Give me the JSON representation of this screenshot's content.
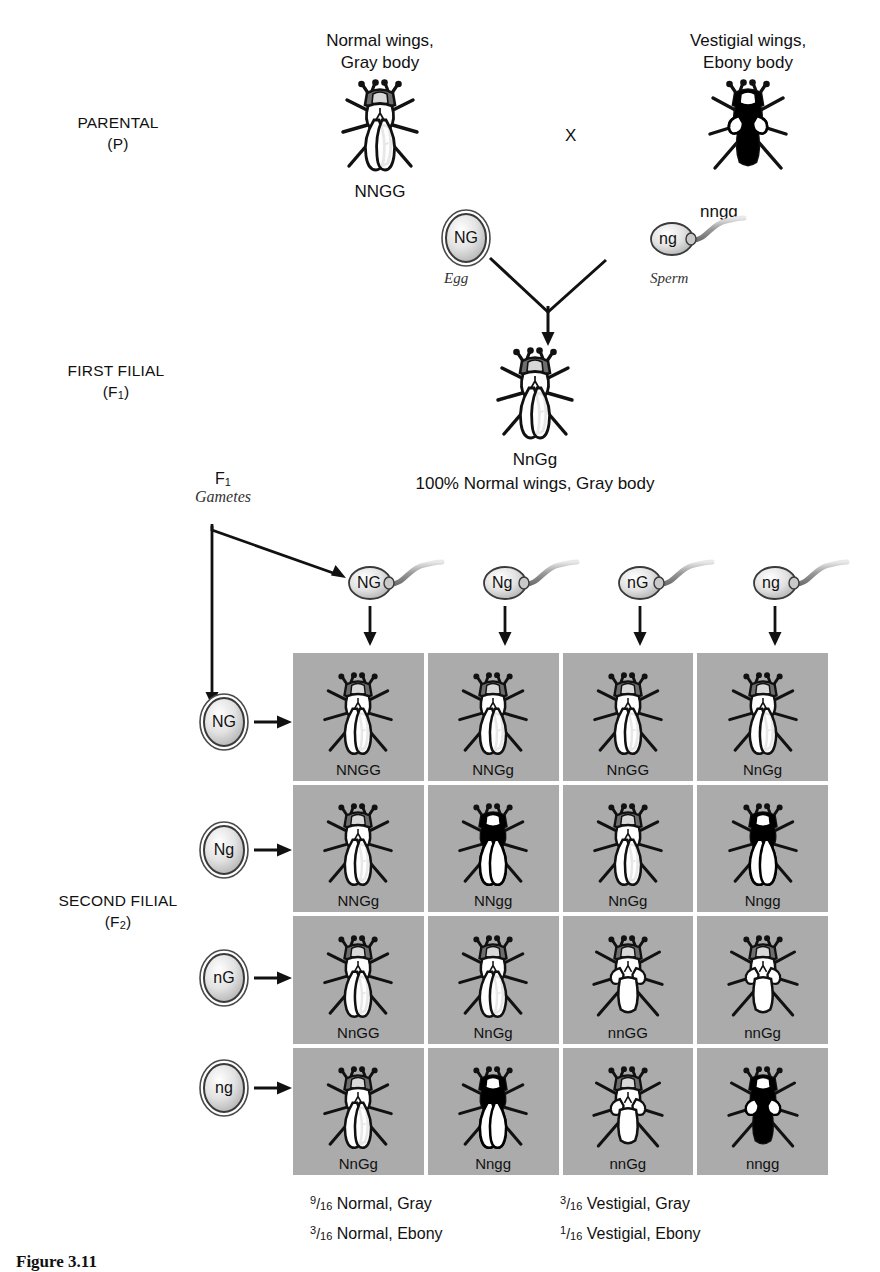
{
  "figure": {
    "caption": "Figure 3.11",
    "cross_symbol": "X"
  },
  "generations": {
    "parental": {
      "label_line1": "PARENTAL",
      "label_line2": "(P)"
    },
    "f1": {
      "label_line1": "FIRST FILIAL",
      "label_line2": "(F",
      "label_sub": "1",
      "label_line2_end": ")"
    },
    "f2": {
      "label_line1": "SECOND FILIAL",
      "label_line2": "(F",
      "label_sub": "2",
      "label_line2_end": ")"
    }
  },
  "parents": {
    "mother": {
      "phenotype_line1": "Normal wings,",
      "phenotype_line2": "Gray body",
      "genotype": "NNGG",
      "gamete": "NG",
      "gamete_role": "Egg",
      "wings": "normal",
      "body": "gray"
    },
    "father": {
      "phenotype_line1": "Vestigial wings,",
      "phenotype_line2": "Ebony body",
      "genotype": "nngg",
      "gamete": "ng",
      "gamete_role": "Sperm",
      "wings": "vestigial",
      "body": "ebony"
    }
  },
  "f1_offspring": {
    "genotype": "NnGg",
    "phenotype": "100% Normal wings, Gray body",
    "wings": "normal",
    "body": "gray"
  },
  "f1_gametes": {
    "label_main": "F",
    "label_sub": "1",
    "label_italic": "Gametes",
    "eggs": [
      "NG",
      "Ng",
      "nG",
      "ng"
    ],
    "sperm": [
      "NG",
      "Ng",
      "nG",
      "ng"
    ]
  },
  "punnett": {
    "column_gametes": [
      "NG",
      "Ng",
      "nG",
      "ng"
    ],
    "row_gametes": [
      "NG",
      "Ng",
      "nG",
      "ng"
    ],
    "background_color": "#ababab",
    "cells": [
      {
        "genotype": "NNGG",
        "wings": "normal",
        "body": "gray"
      },
      {
        "genotype": "NNGg",
        "wings": "normal",
        "body": "gray"
      },
      {
        "genotype": "NnGG",
        "wings": "normal",
        "body": "gray"
      },
      {
        "genotype": "NnGg",
        "wings": "normal",
        "body": "gray"
      },
      {
        "genotype": "NNGg",
        "wings": "normal",
        "body": "gray"
      },
      {
        "genotype": "NNgg",
        "wings": "normal",
        "body": "ebony"
      },
      {
        "genotype": "NnGg",
        "wings": "normal",
        "body": "gray"
      },
      {
        "genotype": "Nngg",
        "wings": "normal",
        "body": "ebony"
      },
      {
        "genotype": "NnGG",
        "wings": "normal",
        "body": "gray"
      },
      {
        "genotype": "NnGg",
        "wings": "normal",
        "body": "gray"
      },
      {
        "genotype": "nnGG",
        "wings": "vestigial",
        "body": "gray"
      },
      {
        "genotype": "nnGg",
        "wings": "vestigial",
        "body": "gray"
      },
      {
        "genotype": "NnGg",
        "wings": "normal",
        "body": "gray"
      },
      {
        "genotype": "Nngg",
        "wings": "normal",
        "body": "ebony"
      },
      {
        "genotype": "nnGg",
        "wings": "vestigial",
        "body": "gray"
      },
      {
        "genotype": "nngg",
        "wings": "vestigial",
        "body": "ebony"
      }
    ]
  },
  "ratios": {
    "left": [
      {
        "numerator": "9",
        "denominator": "16",
        "text": "Normal, Gray"
      },
      {
        "numerator": "3",
        "denominator": "16",
        "text": "Normal, Ebony"
      }
    ],
    "right": [
      {
        "numerator": "3",
        "denominator": "16",
        "text": "Vestigial, Gray"
      },
      {
        "numerator": "1",
        "denominator": "16",
        "text": "Vestigial, Ebony"
      }
    ]
  },
  "colors": {
    "grid_gray": "#ababab",
    "ebony_body": "#000000",
    "gray_body": "#ffffff",
    "ink": "#111111"
  }
}
